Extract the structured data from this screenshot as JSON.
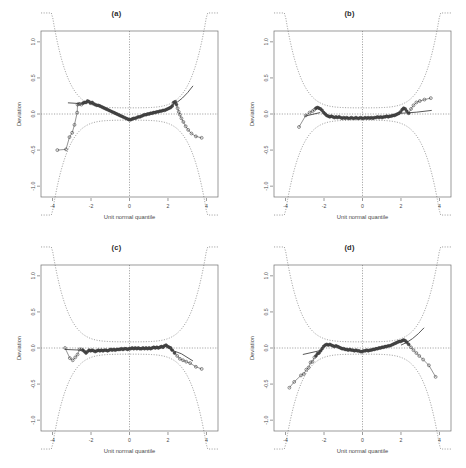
{
  "figure": {
    "width": 466,
    "height": 468,
    "background": "#ffffff",
    "layout": "2x2 grid of panels",
    "ink_color": "#4a4a4a"
  },
  "chart_data": [
    {
      "type": "scatter",
      "panel": "a",
      "title": "(a)",
      "xlabel": "Unit normal quantile",
      "ylabel": "Deviation",
      "xlim": [
        -4.6,
        4.6
      ],
      "ylim": [
        -1.15,
        1.15
      ],
      "xticks": [
        -4,
        -2,
        0,
        2,
        4
      ],
      "xticklabels": [
        "-4",
        "-2",
        "0",
        "2",
        "4"
      ],
      "yticks": [
        -1.0,
        -0.5,
        0.0,
        0.5,
        1.0
      ],
      "yticklabels": [
        "-1.0",
        "-0.5",
        "0.0",
        "0.5",
        "1.0"
      ],
      "grid": false,
      "reference_line_y": 0.0,
      "reference_line_x": 0.0,
      "legend": "none",
      "annotations": [],
      "series": [
        {
          "name": "detrended sample quantiles",
          "marker": "open circle",
          "x": [
            -3.75,
            -3.3,
            -3.12,
            -2.98,
            -2.86,
            -2.72,
            -2.7,
            -2.64,
            -2.58,
            -2.5,
            -2.42,
            -2.34,
            -2.26,
            -2.18,
            -2.1,
            -2.02,
            -1.94,
            -1.86,
            -1.78,
            -1.7,
            -1.62,
            -1.54,
            -1.46,
            -1.38,
            -1.3,
            -1.22,
            -1.14,
            -1.06,
            -0.98,
            -0.9,
            -0.82,
            -0.74,
            -0.66,
            -0.58,
            -0.5,
            -0.42,
            -0.34,
            -0.26,
            -0.18,
            -0.1,
            -0.02,
            0.06,
            0.14,
            0.22,
            0.3,
            0.38,
            0.46,
            0.54,
            0.62,
            0.7,
            0.78,
            0.86,
            0.94,
            1.02,
            1.1,
            1.18,
            1.26,
            1.34,
            1.42,
            1.5,
            1.58,
            1.66,
            1.74,
            1.82,
            1.9,
            1.98,
            2.06,
            2.14,
            2.22,
            2.3,
            2.38,
            2.44,
            2.5,
            2.56,
            2.62,
            2.7,
            2.8,
            2.92,
            3.05,
            3.22,
            3.45,
            3.75
          ],
          "y": [
            -0.5,
            -0.49,
            -0.32,
            -0.26,
            -0.15,
            0.02,
            0.13,
            0.14,
            0.14,
            0.13,
            0.15,
            0.16,
            0.16,
            0.18,
            0.17,
            0.15,
            0.16,
            0.14,
            0.13,
            0.12,
            0.12,
            0.11,
            0.1,
            0.09,
            0.08,
            0.07,
            0.06,
            0.05,
            0.04,
            0.03,
            0.02,
            0.01,
            0.0,
            -0.01,
            -0.02,
            -0.03,
            -0.04,
            -0.05,
            -0.06,
            -0.07,
            -0.08,
            -0.08,
            -0.07,
            -0.06,
            -0.06,
            -0.05,
            -0.04,
            -0.04,
            -0.03,
            -0.02,
            -0.01,
            -0.01,
            0.0,
            0.0,
            0.01,
            0.01,
            0.02,
            0.02,
            0.03,
            0.03,
            0.04,
            0.04,
            0.05,
            0.05,
            0.06,
            0.07,
            0.08,
            0.09,
            0.11,
            0.16,
            0.17,
            0.13,
            0.08,
            0.03,
            -0.01,
            -0.06,
            -0.11,
            -0.17,
            -0.22,
            -0.27,
            -0.31,
            -0.33
          ]
        }
      ],
      "fitted_line": {
        "name": "robust fit",
        "x": [
          -3.2,
          -2.6
        ],
        "y": [
          0.155,
          0.145
        ],
        "x2": [
          2.2,
          3.3
        ],
        "y2": [
          0.12,
          0.39
        ]
      },
      "envelope": {
        "name": "pointwise confidence envelope",
        "style": "dashed"
      }
    },
    {
      "type": "scatter",
      "panel": "b",
      "title": "(b)",
      "xlabel": "Unit normal quantile",
      "ylabel": "Deviation",
      "xlim": [
        -4.6,
        4.6
      ],
      "ylim": [
        -1.15,
        1.15
      ],
      "xticks": [
        -4,
        -2,
        0,
        2,
        4
      ],
      "xticklabels": [
        "-4",
        "-2",
        "0",
        "2",
        "4"
      ],
      "yticks": [
        -1.0,
        -0.5,
        0.0,
        0.5,
        1.0
      ],
      "yticklabels": [
        "-1.0",
        "-0.5",
        "0.0",
        "0.5",
        "1.0"
      ],
      "grid": false,
      "reference_line_y": 0.0,
      "reference_line_x": 0.0,
      "legend": "none",
      "annotations": [],
      "series": [
        {
          "name": "detrended sample quantiles",
          "marker": "open circle",
          "x": [
            -3.3,
            -2.95,
            -2.75,
            -2.6,
            -2.5,
            -2.42,
            -2.34,
            -2.26,
            -2.18,
            -2.1,
            -2.02,
            -1.94,
            -1.86,
            -1.78,
            -1.7,
            -1.62,
            -1.54,
            -1.46,
            -1.38,
            -1.3,
            -1.22,
            -1.14,
            -1.06,
            -0.98,
            -0.9,
            -0.82,
            -0.74,
            -0.66,
            -0.58,
            -0.5,
            -0.42,
            -0.34,
            -0.26,
            -0.18,
            -0.1,
            -0.02,
            0.06,
            0.14,
            0.22,
            0.3,
            0.38,
            0.46,
            0.54,
            0.62,
            0.7,
            0.78,
            0.86,
            0.94,
            1.02,
            1.1,
            1.18,
            1.26,
            1.34,
            1.42,
            1.5,
            1.58,
            1.66,
            1.74,
            1.82,
            1.9,
            1.98,
            2.06,
            2.14,
            2.22,
            2.3,
            2.4,
            2.52,
            2.65,
            2.8,
            2.98,
            3.22,
            3.55
          ],
          "y": [
            -0.18,
            -0.02,
            0.02,
            0.04,
            0.06,
            0.08,
            0.09,
            0.08,
            0.07,
            0.05,
            0.02,
            0.0,
            -0.02,
            -0.03,
            -0.04,
            -0.03,
            -0.04,
            -0.05,
            -0.04,
            -0.05,
            -0.04,
            -0.05,
            -0.06,
            -0.05,
            -0.06,
            -0.05,
            -0.06,
            -0.06,
            -0.05,
            -0.06,
            -0.06,
            -0.05,
            -0.06,
            -0.06,
            -0.05,
            -0.06,
            -0.06,
            -0.05,
            -0.06,
            -0.05,
            -0.06,
            -0.05,
            -0.06,
            -0.05,
            -0.05,
            -0.04,
            -0.05,
            -0.04,
            -0.05,
            -0.04,
            -0.04,
            -0.03,
            -0.04,
            -0.03,
            -0.03,
            -0.02,
            -0.02,
            -0.01,
            0.0,
            0.01,
            0.03,
            0.06,
            0.08,
            0.07,
            0.04,
            0.01,
            0.07,
            0.12,
            0.16,
            0.18,
            0.2,
            0.22
          ]
        }
      ],
      "fitted_line": {
        "name": "robust fit",
        "x": [
          -3.0,
          -2.2
        ],
        "y": [
          -0.03,
          0.02
        ],
        "x2": [
          2.0,
          3.6
        ],
        "y2": [
          0.01,
          0.05
        ]
      },
      "envelope": {
        "name": "pointwise confidence envelope",
        "style": "dashed"
      }
    },
    {
      "type": "scatter",
      "panel": "c",
      "title": "(c)",
      "xlabel": "Unit normal quantile",
      "ylabel": "Deviation",
      "xlim": [
        -4.6,
        4.6
      ],
      "ylim": [
        -1.15,
        1.15
      ],
      "xticks": [
        -4,
        -2,
        0,
        2,
        4
      ],
      "xticklabels": [
        "-4",
        "-2",
        "0",
        "2",
        "4"
      ],
      "yticks": [
        -1.0,
        -0.5,
        0.0,
        0.5,
        1.0
      ],
      "yticklabels": [
        "-1.0",
        "-0.5",
        "0.0",
        "0.5",
        "1.0"
      ],
      "grid": false,
      "reference_line_y": 0.0,
      "reference_line_x": 0.0,
      "legend": "none",
      "annotations": [],
      "series": [
        {
          "name": "detrended sample quantiles",
          "marker": "open circle",
          "x": [
            -3.35,
            -3.1,
            -2.95,
            -2.82,
            -2.7,
            -2.6,
            -2.5,
            -2.42,
            -2.34,
            -2.26,
            -2.18,
            -2.1,
            -2.02,
            -1.94,
            -1.86,
            -1.78,
            -1.7,
            -1.62,
            -1.54,
            -1.46,
            -1.38,
            -1.3,
            -1.22,
            -1.14,
            -1.06,
            -0.98,
            -0.9,
            -0.82,
            -0.74,
            -0.66,
            -0.58,
            -0.5,
            -0.42,
            -0.34,
            -0.26,
            -0.18,
            -0.1,
            -0.02,
            0.06,
            0.14,
            0.22,
            0.3,
            0.38,
            0.46,
            0.54,
            0.62,
            0.7,
            0.78,
            0.86,
            0.94,
            1.02,
            1.1,
            1.18,
            1.26,
            1.34,
            1.42,
            1.5,
            1.58,
            1.66,
            1.74,
            1.82,
            1.9,
            1.98,
            2.06,
            2.14,
            2.22,
            2.34,
            2.48,
            2.62,
            2.78,
            2.95,
            3.15,
            3.45,
            3.75
          ],
          "y": [
            0.0,
            -0.14,
            -0.17,
            -0.13,
            -0.09,
            -0.02,
            -0.02,
            -0.03,
            -0.05,
            -0.07,
            -0.05,
            -0.03,
            -0.04,
            -0.03,
            -0.04,
            -0.05,
            -0.04,
            -0.03,
            -0.04,
            -0.03,
            -0.04,
            -0.03,
            -0.03,
            -0.04,
            -0.03,
            -0.02,
            -0.03,
            -0.02,
            -0.03,
            -0.02,
            -0.02,
            -0.02,
            -0.01,
            -0.02,
            -0.01,
            -0.01,
            -0.02,
            -0.01,
            -0.01,
            0.0,
            -0.01,
            0.0,
            -0.01,
            0.0,
            -0.01,
            -0.01,
            0.0,
            -0.01,
            0.0,
            -0.01,
            0.0,
            -0.01,
            0.0,
            0.01,
            0.0,
            0.01,
            0.0,
            0.01,
            0.02,
            0.01,
            0.03,
            0.04,
            0.02,
            0.01,
            0.0,
            -0.03,
            -0.07,
            -0.11,
            -0.15,
            -0.17,
            -0.19,
            -0.21,
            -0.26,
            -0.29
          ]
        }
      ],
      "fitted_line": {
        "name": "robust fit",
        "x": [
          -3.35,
          -2.5
        ],
        "y": [
          -0.02,
          -0.03
        ],
        "x2": [
          2.1,
          3.3
        ],
        "y2": [
          -0.02,
          -0.18
        ]
      },
      "envelope": {
        "name": "pointwise confidence envelope",
        "style": "dashed"
      }
    },
    {
      "type": "scatter",
      "panel": "d",
      "title": "(d)",
      "xlabel": "Unit normal quantile",
      "ylabel": "Deviation",
      "xlim": [
        -4.6,
        4.6
      ],
      "ylim": [
        -1.15,
        1.15
      ],
      "xticks": [
        -4,
        -2,
        0,
        2,
        4
      ],
      "xticklabels": [
        "-4",
        "-2",
        "0",
        "2",
        "4"
      ],
      "yticks": [
        -1.0,
        -0.5,
        0.0,
        0.5,
        1.0
      ],
      "yticklabels": [
        "-1.0",
        "-0.5",
        "0.0",
        "0.5",
        "1.0"
      ],
      "grid": false,
      "reference_line_y": 0.0,
      "reference_line_x": 0.0,
      "legend": "none",
      "annotations": [],
      "series": [
        {
          "name": "detrended sample quantiles",
          "marker": "open circle",
          "x": [
            -3.8,
            -3.55,
            -3.2,
            -3.05,
            -2.92,
            -2.8,
            -2.7,
            -2.6,
            -2.5,
            -2.42,
            -2.34,
            -2.26,
            -2.18,
            -2.1,
            -2.02,
            -1.94,
            -1.86,
            -1.78,
            -1.7,
            -1.62,
            -1.54,
            -1.46,
            -1.38,
            -1.3,
            -1.22,
            -1.14,
            -1.06,
            -0.98,
            -0.9,
            -0.82,
            -0.74,
            -0.66,
            -0.58,
            -0.5,
            -0.42,
            -0.34,
            -0.26,
            -0.18,
            -0.1,
            -0.02,
            0.06,
            0.14,
            0.22,
            0.3,
            0.38,
            0.46,
            0.54,
            0.62,
            0.7,
            0.78,
            0.86,
            0.94,
            1.02,
            1.1,
            1.18,
            1.26,
            1.34,
            1.42,
            1.5,
            1.58,
            1.66,
            1.74,
            1.82,
            1.9,
            1.98,
            2.06,
            2.14,
            2.22,
            2.3,
            2.4,
            2.52,
            2.65,
            2.8,
            2.95,
            3.15,
            3.45,
            3.8
          ],
          "y": [
            -0.55,
            -0.47,
            -0.38,
            -0.36,
            -0.3,
            -0.27,
            -0.2,
            -0.19,
            -0.13,
            -0.11,
            -0.08,
            -0.07,
            -0.04,
            -0.01,
            0.02,
            0.04,
            0.05,
            0.04,
            0.05,
            0.04,
            0.03,
            0.02,
            0.03,
            0.02,
            0.01,
            0.0,
            -0.01,
            -0.01,
            -0.02,
            -0.02,
            -0.03,
            -0.02,
            -0.03,
            -0.03,
            -0.04,
            -0.03,
            -0.04,
            -0.04,
            -0.05,
            -0.05,
            -0.04,
            -0.04,
            -0.03,
            -0.04,
            -0.03,
            -0.03,
            -0.02,
            -0.02,
            -0.01,
            -0.01,
            0.0,
            0.0,
            0.01,
            0.01,
            0.02,
            0.02,
            0.03,
            0.03,
            0.04,
            0.05,
            0.06,
            0.07,
            0.08,
            0.09,
            0.09,
            0.1,
            0.11,
            0.1,
            0.08,
            0.05,
            0.01,
            -0.03,
            -0.07,
            -0.11,
            -0.16,
            -0.24,
            -0.4
          ]
        }
      ],
      "fitted_line": {
        "name": "robust fit",
        "x": [
          -3.1,
          -2.1
        ],
        "y": [
          -0.09,
          -0.03
        ],
        "x2": [
          2.0,
          3.2
        ],
        "y2": [
          0.04,
          0.28
        ]
      },
      "envelope": {
        "name": "pointwise confidence envelope",
        "style": "dashed"
      }
    }
  ]
}
